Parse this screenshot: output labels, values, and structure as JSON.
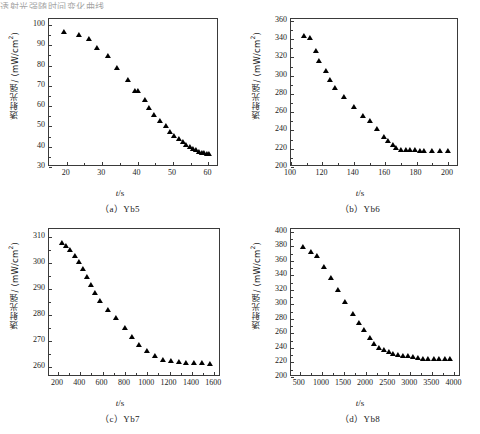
{
  "page": {
    "header_line": "透射光强随时间变化曲线",
    "x_axis_title_symbol": "t",
    "x_axis_title_unit": "/s",
    "y_axis_title": "透射光强/ (mW/cm",
    "y_axis_title_sup": "2",
    "y_axis_title_end": ")"
  },
  "chart_data": [
    {
      "id": "a",
      "type": "scatter",
      "title": "（a）Yb5",
      "caption": "（a）Yb5",
      "xlabel": "t/s",
      "ylabel": "透射光强/ (mW/cm2)",
      "xlim": [
        15,
        63
      ],
      "ylim": [
        30,
        103
      ],
      "xticks": [
        20,
        30,
        40,
        50,
        60
      ],
      "yticks": [
        30,
        40,
        50,
        60,
        70,
        80,
        90,
        100
      ],
      "x": [
        19.3,
        23.6,
        26.3,
        28.6,
        31.6,
        34.3,
        37.2,
        39.3,
        40.2,
        42.0,
        43.2,
        44.7,
        46.4,
        47.9,
        49.2,
        50.4,
        51.6,
        52.7,
        53.8,
        54.8,
        55.7,
        56.6,
        57.4,
        58.2,
        58.9,
        59.6,
        60.2
      ],
      "y": [
        96.2,
        94.5,
        92.8,
        88.4,
        84.1,
        78.3,
        72.6,
        67.0,
        66.8,
        62.8,
        58.5,
        55.0,
        52.2,
        49.6,
        47.0,
        44.8,
        43.2,
        41.8,
        40.4,
        39.3,
        38.4,
        37.7,
        37.1,
        36.6,
        36.2,
        36.0,
        35.8
      ]
    },
    {
      "id": "b",
      "type": "scatter",
      "title": "（b）Yb6",
      "caption": "（b）Yb6",
      "xlabel": "t/s",
      "ylabel": "透射光强/ (mW/cm2)",
      "xlim": [
        100,
        207
      ],
      "ylim": [
        200,
        362
      ],
      "xticks": [
        100,
        120,
        140,
        160,
        180,
        200
      ],
      "yticks": [
        200,
        220,
        240,
        260,
        280,
        300,
        320,
        340,
        360
      ],
      "x": [
        108,
        112,
        116,
        118,
        122,
        125,
        128,
        134,
        140,
        146,
        150,
        155,
        159,
        162,
        165,
        167,
        170,
        173,
        176,
        179,
        182,
        185,
        190,
        195,
        200
      ],
      "y": [
        342,
        340,
        326,
        315,
        304,
        294,
        285,
        275,
        265,
        255,
        249,
        240,
        232,
        227,
        223,
        220,
        218,
        217,
        217,
        217,
        216,
        216,
        216,
        216,
        216
      ]
    },
    {
      "id": "c",
      "type": "scatter",
      "title": "（c）Yb7",
      "caption": "（c）Yb7",
      "xlabel": "t/s",
      "ylabel": "透射光强/ (mW/cm2)",
      "xlim": [
        120,
        1660
      ],
      "ylim": [
        256,
        313
      ],
      "xticks": [
        200,
        400,
        600,
        800,
        1000,
        1200,
        1400,
        1600
      ],
      "yticks": [
        260,
        270,
        280,
        290,
        300,
        310
      ],
      "x": [
        235,
        275,
        310,
        350,
        390,
        425,
        460,
        495,
        530,
        580,
        650,
        720,
        800,
        865,
        930,
        1000,
        1065,
        1140,
        1210,
        1280,
        1350,
        1420,
        1490,
        1560
      ],
      "y": [
        307.4,
        306.0,
        304.5,
        302.2,
        300.0,
        297.2,
        294.1,
        291.0,
        288.0,
        285.0,
        281.5,
        278.4,
        274.4,
        271.2,
        268.0,
        265.6,
        263.6,
        262.3,
        261.8,
        261.3,
        261.1,
        261.0,
        260.9,
        260.8
      ]
    },
    {
      "id": "d",
      "type": "scatter",
      "title": "（d）Yb8",
      "caption": "（d）Yb8",
      "xlabel": "t/s",
      "ylabel": "透射光强/ (mW/cm2)",
      "xlim": [
        300,
        4150
      ],
      "ylim": [
        200,
        404
      ],
      "xticks": [
        500,
        1000,
        1500,
        2000,
        2500,
        3000,
        3500,
        4000
      ],
      "yticks": [
        200,
        220,
        240,
        260,
        280,
        300,
        320,
        340,
        360,
        380,
        400
      ],
      "x": [
        570,
        745,
        900,
        1040,
        1210,
        1370,
        1530,
        1700,
        1840,
        1960,
        2080,
        2190,
        2300,
        2410,
        2520,
        2620,
        2720,
        2830,
        2950,
        3060,
        3180,
        3290,
        3410,
        3530,
        3660,
        3790,
        3900
      ],
      "y": [
        378,
        371,
        366,
        350,
        335,
        318,
        302,
        286,
        273,
        264,
        252,
        244,
        239,
        236,
        233,
        231,
        229,
        228,
        227,
        226,
        225,
        224,
        224,
        224,
        224,
        224,
        224
      ]
    }
  ]
}
